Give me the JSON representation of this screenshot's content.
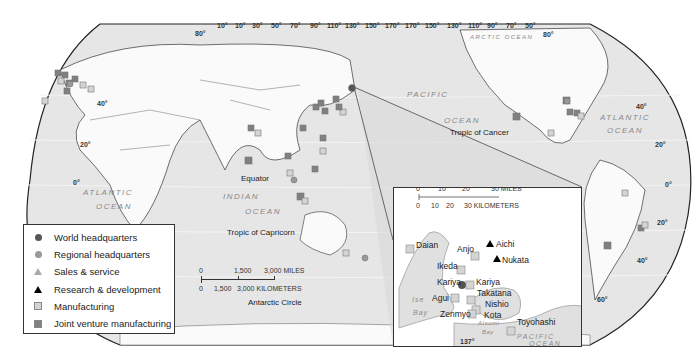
{
  "map": {
    "top_longitudes": [
      "10°",
      "10°",
      "30°",
      "50°",
      "70°",
      "90°",
      "110°",
      "130°",
      "150°",
      "170°",
      "170°",
      "150°",
      "130°",
      "110°",
      "90°",
      "70°",
      "50°"
    ],
    "latitudes": {
      "left_80": "80°",
      "left_40": "40°",
      "left_20": "20°",
      "left_0": "0°",
      "right_80": "80°",
      "right_40": "40°",
      "right_20n": "20°",
      "right_0": "0°",
      "right_20s": "20°",
      "right_40s": "40°",
      "right_60s": "60°"
    },
    "labels": {
      "arctic_ocean": "ARCTIC OCEAN",
      "pacific": "PACIFIC",
      "ocean_pacific": "OCEAN",
      "tropic_cancer": "Tropic of Cancer",
      "atlantic_right": "ATLANTIC",
      "ocean_atlantic_right": "OCEAN",
      "atlantic_left": "ATLANTIC",
      "ocean_atlantic_left": "OCEAN",
      "indian": "INDIAN",
      "ocean_indian": "OCEAN",
      "equator": "Equator",
      "tropic_capricorn": "Tropic of Capricorn",
      "antarctic_circle": "Antarctic Circle"
    },
    "scale": {
      "miles": [
        "0",
        "1,500",
        "3,000 MILES"
      ],
      "km": [
        "0",
        "1,500",
        "3,000 KILOMETERS"
      ]
    }
  },
  "legend": {
    "items": [
      {
        "label": "World headquarters",
        "symbol": "circle",
        "color": "#555555"
      },
      {
        "label": "Regional headquarters",
        "symbol": "circle",
        "color": "#999999"
      },
      {
        "label": "Sales & service",
        "symbol": "triangle",
        "color": "#aaaaaa"
      },
      {
        "label": "Research & development",
        "symbol": "triangle",
        "color": "#000000"
      },
      {
        "label": "Manufacturing",
        "symbol": "square",
        "color": "#d4d4d4"
      },
      {
        "label": "Joint venture manufacturing",
        "symbol": "square",
        "color": "#808080"
      }
    ]
  },
  "inset": {
    "scale": {
      "miles": [
        "0",
        "10",
        "20",
        "30 MILES"
      ],
      "km": [
        "0",
        "10",
        "20",
        "30 KILOMETERS"
      ]
    },
    "places": {
      "daian": "Daian",
      "anjo": "Anjo",
      "aichi": "Aichi",
      "ikeda": "Ikeda",
      "nukata": "Nukata",
      "kariya1": "Kariya",
      "kariya2": "Kariya",
      "agui": "Agui",
      "takatana": "Takatana",
      "nishio": "Nishio",
      "zenmyo": "Zenmyo",
      "kota": "Kota",
      "toyohashi": "Toyohashi"
    },
    "water": {
      "ise": "Ise",
      "bay1": "Bay",
      "atsumi": "Atsumi",
      "bay2": "Bay",
      "pacific": "PACIFIC",
      "ocean": "OCEAN"
    },
    "longitude": "137°"
  }
}
